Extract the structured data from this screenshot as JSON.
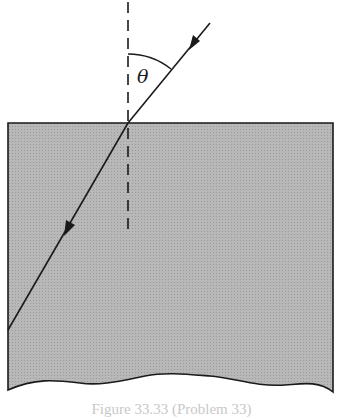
{
  "diagram": {
    "angle_label": "θ",
    "caption": "Figure 33.33 (Problem 33)",
    "colors": {
      "medium_fill": "#b4b4b4",
      "line": "#1a1a1a",
      "background": "#ffffff"
    },
    "elements": {
      "medium": "rectangular block of transparent material (shaded), wavy bottom edge",
      "normal": "dashed vertical normal line at point of incidence",
      "incident_ray": "ray from upper right toward surface with arrow",
      "refracted_ray": "ray inside medium bending toward normal, arrow pointing down-left",
      "angle": "angle θ between incident ray and normal"
    }
  }
}
